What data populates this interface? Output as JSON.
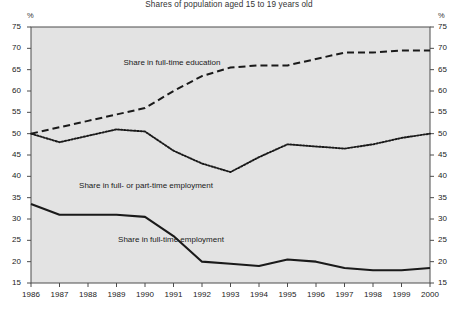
{
  "chart_data": {
    "type": "line",
    "title": "Shares of population aged 15 to 19 years old",
    "xlabel": "",
    "ylabel": "",
    "unit_left": "%",
    "unit_right": "%",
    "grid": false,
    "legend_position": "inline-labels",
    "ylim": [
      15,
      75
    ],
    "ytick_step": 5,
    "yticks": [
      15,
      20,
      25,
      30,
      35,
      40,
      45,
      50,
      55,
      60,
      65,
      70,
      75
    ],
    "x": [
      1986,
      1987,
      1988,
      1989,
      1990,
      1991,
      1992,
      1993,
      1994,
      1995,
      1996,
      1997,
      1998,
      1999,
      2000
    ],
    "xticks": [
      "1986",
      "1987",
      "1988",
      "1989",
      "1990",
      "1991",
      "1992",
      "1993",
      "1994",
      "1995",
      "1996",
      "1997",
      "1998",
      "1999",
      "2000"
    ],
    "series": [
      {
        "name": "Share in full-time education",
        "style": "dashed",
        "color": "#1a1a1a",
        "values": [
          50.0,
          51.5,
          53.0,
          54.5,
          56.0,
          60.0,
          63.5,
          65.5,
          66.0,
          66.0,
          67.5,
          69.0,
          69.0,
          69.5,
          69.5
        ]
      },
      {
        "name": "Share in full- or part-time employment",
        "style": "dotted",
        "color": "#1a1a1a",
        "values": [
          50.0,
          48.0,
          49.5,
          51.0,
          50.5,
          46.0,
          43.0,
          41.0,
          44.5,
          47.5,
          47.0,
          46.5,
          47.5,
          49.0,
          50.0
        ]
      },
      {
        "name": "Share in full-time employment",
        "style": "solid",
        "color": "#1a1a1a",
        "values": [
          33.5,
          31.0,
          31.0,
          31.0,
          30.5,
          26.0,
          20.0,
          19.5,
          19.0,
          20.5,
          20.0,
          18.5,
          18.0,
          18.0,
          18.5
        ]
      }
    ],
    "annotations": [
      {
        "text": "Share in full-time education",
        "x_px": 172,
        "y_px": 58
      },
      {
        "text": "Share in full- or part-time employment",
        "x_px": 146,
        "y_px": 181
      },
      {
        "text": "Share in full-time employment",
        "x_px": 171,
        "y_px": 235
      }
    ],
    "plot_background": "#e3e3e3",
    "plot_border": "#4d4d4d"
  }
}
